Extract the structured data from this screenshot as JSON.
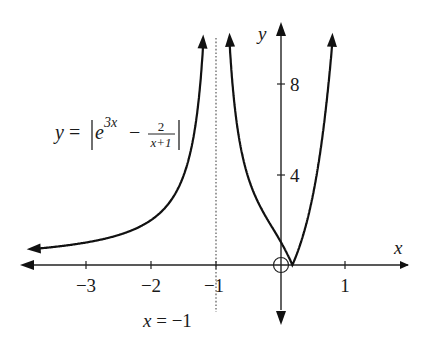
{
  "chart_data": {
    "type": "line",
    "title": "",
    "equation_label": {
      "lhs": "y",
      "eq": "=",
      "base": "e",
      "exponent": "3x",
      "minus": "−",
      "frac_num": "2",
      "frac_den": "x+1"
    },
    "xlabel": "x",
    "ylabel": "y",
    "x_ticks": [
      -3,
      -2,
      -1,
      1
    ],
    "x_tick_labels": [
      "−3",
      "−2",
      "−1",
      "1"
    ],
    "y_ticks": [
      4,
      8
    ],
    "y_tick_labels": [
      "4",
      "8"
    ],
    "xlim": [
      -4,
      2
    ],
    "ylim": [
      -3,
      11
    ],
    "asymptote": {
      "x": -1,
      "label": "x = −1",
      "style": "dotted"
    },
    "open_point": {
      "x": 0,
      "y": 0
    },
    "series": [
      {
        "name": "y = |e^(3x) − 2/(x+1)|, x < −1",
        "x": [
          -3.9,
          -3,
          -2.5,
          -2,
          -1.6,
          -1.3,
          -1.15,
          -1.07
        ],
        "y": [
          0.69,
          1.0,
          1.33,
          2.0,
          3.33,
          6.67,
          13.3,
          28.6
        ]
      },
      {
        "name": "y = |e^(3x) − 2/(x+1)|, x > −1",
        "x": [
          -0.9,
          -0.8,
          -0.6,
          -0.4,
          -0.2,
          0,
          0.1,
          0.2,
          0.4,
          0.6,
          0.75
        ],
        "y": [
          19.9,
          9.9,
          4.8,
          3.0,
          2.0,
          1.0,
          0.47,
          0.15,
          1.9,
          4.8,
          8.4
        ]
      }
    ],
    "grid": false,
    "legend": null
  }
}
